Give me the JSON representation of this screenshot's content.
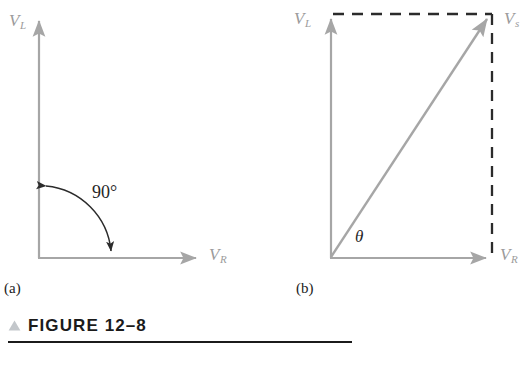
{
  "figure": {
    "caption_marker": "triangle-up",
    "caption_label": "FIGURE 12–8",
    "accent_color": "#b0b4b8",
    "axis_color": "#9b9b9b",
    "ink_color": "#262626",
    "rule_color": "#1b1b1b"
  },
  "panels": [
    {
      "letter": "(a)",
      "name": "right-angle-phasor-diagram",
      "axes": {
        "vertical_label_base": "V",
        "vertical_label_sub": "L",
        "horizontal_label_base": "V",
        "horizontal_label_sub": "R"
      },
      "annotation": {
        "text": "90°",
        "kind": "double-headed-arc"
      }
    },
    {
      "letter": "(b)",
      "name": "resultant-phasor-diagram",
      "axes": {
        "vertical_label_base": "V",
        "vertical_label_sub": "L",
        "horizontal_label_base": "V",
        "horizontal_label_sub": "R"
      },
      "resultant": {
        "label_base": "V",
        "label_sub": "s",
        "kind": "arrow"
      },
      "annotation": {
        "text": "θ",
        "kind": "angle-symbol"
      },
      "construction": {
        "kind": "dashed-rectangle"
      }
    }
  ]
}
